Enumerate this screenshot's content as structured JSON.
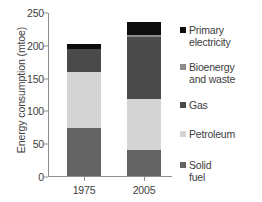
{
  "chart_data": {
    "type": "bar",
    "subtype": "stacked-vertical",
    "title": "",
    "xlabel": "",
    "ylabel": "Energy consumption (mtoe)",
    "categories": [
      "1975",
      "2005"
    ],
    "ylim": [
      0,
      250
    ],
    "yticks": [
      0,
      50,
      100,
      150,
      200,
      250
    ],
    "ytick_labels": [
      "0",
      "50",
      "100",
      "150",
      "200",
      "250"
    ],
    "grid": false,
    "legend_position": "right",
    "units": "mtoe",
    "series": [
      {
        "name": "Solid fuel",
        "color": "#636363",
        "values": [
          73,
          40
        ]
      },
      {
        "name": "Petroleum",
        "color": "#d4d4d4",
        "values": [
          85,
          78
        ]
      },
      {
        "name": "Gas",
        "color": "#4a4a4a",
        "values": [
          36,
          94
        ]
      },
      {
        "name": "Bioenergy and waste",
        "color": "#8c8c8c",
        "values": [
          0,
          3
        ]
      },
      {
        "name": "Primary electricity",
        "color": "#0d0d0d",
        "values": [
          8,
          20
        ]
      }
    ],
    "totals": [
      202,
      235
    ],
    "legend_entries": [
      {
        "label": "Primary\nelectricity",
        "color": "#0d0d0d",
        "name": "primary-electricity"
      },
      {
        "label": "Bioenergy\nand waste",
        "color": "#8c8c8c",
        "name": "bioenergy-and-waste"
      },
      {
        "label": "Gas",
        "color": "#4a4a4a",
        "name": "gas"
      },
      {
        "label": "Petroleum",
        "color": "#d4d4d4",
        "name": "petroleum"
      },
      {
        "label": "Solid\nfuel",
        "color": "#636363",
        "name": "solid-fuel"
      }
    ]
  },
  "axis": {
    "y_title": "Energy consumption (mtoe)",
    "y_ticks": [
      "250",
      "200",
      "150",
      "100",
      "50",
      "0"
    ],
    "x_labels": [
      "1975",
      "2005"
    ]
  },
  "colors": {
    "axis": "#8d8d8d",
    "text": "#3d3d3d",
    "background": "#ffffff"
  }
}
